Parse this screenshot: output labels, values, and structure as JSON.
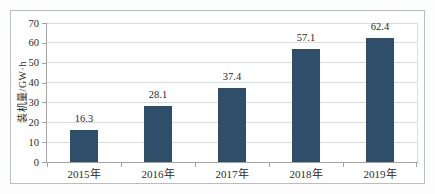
{
  "figure": {
    "background": "#ffffff",
    "frame_color": "#b9bdc0"
  },
  "chart_data": {
    "type": "bar",
    "categories": [
      "2015年",
      "2016年",
      "2017年",
      "2018年",
      "2019年"
    ],
    "values": [
      16.3,
      28.1,
      37.4,
      57.1,
      62.4
    ],
    "data_labels": [
      "16.3",
      "28.1",
      "37.4",
      "57.1",
      "62.4"
    ],
    "title": "",
    "xlabel": "",
    "ylabel": "装机量/GW·h",
    "ylim": [
      0,
      70
    ],
    "yticks": [
      0,
      10,
      20,
      30,
      40,
      50,
      60,
      70
    ],
    "grid": true,
    "legend": "none",
    "bar_color": "#2f4e6a",
    "grid_color": "#dcdcdc",
    "axis_color": "#a3a3a3",
    "text_color": "#1f1f1f"
  }
}
